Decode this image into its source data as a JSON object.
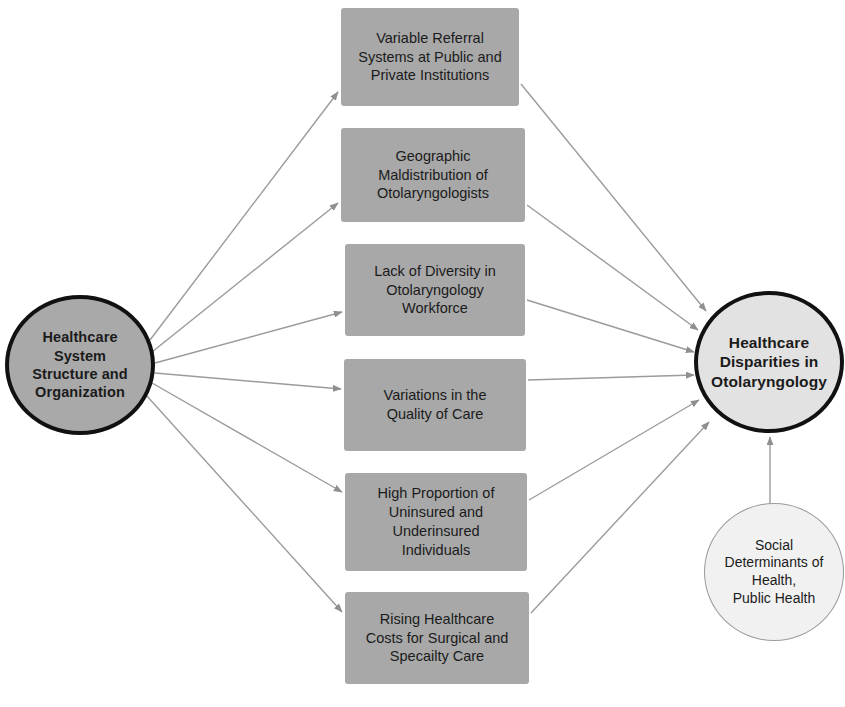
{
  "diagram": {
    "colors": {
      "background": "#ffffff",
      "source_circle_fill": "#a9a9a9",
      "outcome_circle_fill": "#e2e2e2",
      "secondary_circle_fill": "#f1f1f1",
      "box_fill": "#a8a8a8",
      "node_outline": "#111111",
      "secondary_outline": "#9a9a9a",
      "edge_color": "#9b9b9b",
      "text": "#1b1b1b"
    }
  },
  "nodes": {
    "source": {
      "id": "healthcare-system-structure",
      "label": "Healthcare\nSystem\nStructure and\nOrganization",
      "shape": "circle",
      "x": 5,
      "y": 295,
      "width": 150,
      "height": 140
    },
    "outcome": {
      "id": "healthcare-disparities",
      "label": "Healthcare\nDisparities in\nOtolaryngology",
      "shape": "circle",
      "x": 694,
      "y": 291,
      "width": 150,
      "height": 142
    },
    "secondary": {
      "id": "social-determinants",
      "label": "Social\nDeterminants of\nHealth,\nPublic Health",
      "shape": "circle",
      "x": 704,
      "y": 503,
      "width": 140,
      "height": 138
    },
    "mediators": [
      {
        "id": "variable-referral-systems",
        "label": "Variable Referral\nSystems at Public and\nPrivate Institutions",
        "shape": "box",
        "x": 341,
        "y": 8,
        "width": 178,
        "height": 98
      },
      {
        "id": "geographic-maldistribution",
        "label": "Geographic\nMaldistribution of\nOtolaryngologists",
        "shape": "box",
        "x": 341,
        "y": 128,
        "width": 184,
        "height": 94
      },
      {
        "id": "lack-of-diversity",
        "label": "Lack of Diversity in\nOtolaryngology\nWorkforce",
        "shape": "box",
        "x": 345,
        "y": 244,
        "width": 180,
        "height": 92
      },
      {
        "id": "variations-quality-of-care",
        "label": "Variations in the\nQuality of Care",
        "shape": "box",
        "x": 344,
        "y": 359,
        "width": 182,
        "height": 92
      },
      {
        "id": "high-proportion-uninsured",
        "label": "High Proportion of\nUninsured and\nUnderinsured\nIndividuals",
        "shape": "box",
        "x": 345,
        "y": 473,
        "width": 182,
        "height": 98
      },
      {
        "id": "rising-healthcare-costs",
        "label": "Rising Healthcare\nCosts for Surgical and\nSpecailty Care",
        "shape": "box",
        "x": 345,
        "y": 592,
        "width": 184,
        "height": 92
      }
    ]
  },
  "edges": {
    "from_source": [
      {
        "from": "healthcare-system-structure",
        "to": "variable-referral-systems",
        "x1": 150,
        "y1": 340,
        "x2": 338,
        "y2": 92
      },
      {
        "from": "healthcare-system-structure",
        "to": "geographic-maldistribution",
        "x1": 152,
        "y1": 352,
        "x2": 338,
        "y2": 203
      },
      {
        "from": "healthcare-system-structure",
        "to": "lack-of-diversity",
        "x1": 155,
        "y1": 363,
        "x2": 342,
        "y2": 312
      },
      {
        "from": "healthcare-system-structure",
        "to": "variations-quality-of-care",
        "x1": 155,
        "y1": 373,
        "x2": 341,
        "y2": 389
      },
      {
        "from": "healthcare-system-structure",
        "to": "high-proportion-uninsured",
        "x1": 152,
        "y1": 383,
        "x2": 342,
        "y2": 492
      },
      {
        "from": "healthcare-system-structure",
        "to": "rising-healthcare-costs",
        "x1": 146,
        "y1": 395,
        "x2": 342,
        "y2": 612
      }
    ],
    "to_outcome": [
      {
        "from": "variable-referral-systems",
        "to": "healthcare-disparities",
        "x1": 521,
        "y1": 84,
        "x2": 706,
        "y2": 311
      },
      {
        "from": "geographic-maldistribution",
        "to": "healthcare-disparities",
        "x1": 527,
        "y1": 205,
        "x2": 698,
        "y2": 330
      },
      {
        "from": "lack-of-diversity",
        "to": "healthcare-disparities",
        "x1": 527,
        "y1": 300,
        "x2": 694,
        "y2": 352
      },
      {
        "from": "variations-quality-of-care",
        "to": "healthcare-disparities",
        "x1": 528,
        "y1": 380,
        "x2": 694,
        "y2": 375
      },
      {
        "from": "high-proportion-uninsured",
        "to": "healthcare-disparities",
        "x1": 529,
        "y1": 500,
        "x2": 699,
        "y2": 400
      },
      {
        "from": "rising-healthcare-costs",
        "to": "healthcare-disparities",
        "x1": 531,
        "y1": 613,
        "x2": 709,
        "y2": 422
      },
      {
        "from": "social-determinants",
        "to": "healthcare-disparities",
        "x1": 770,
        "y1": 505,
        "x2": 770,
        "y2": 437
      }
    ]
  }
}
